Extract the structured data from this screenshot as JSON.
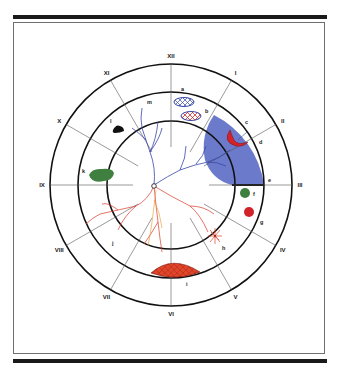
{
  "figure": {
    "type": "fundus-drawing-chart",
    "colors": {
      "frame": "#1a1a1a",
      "circle": "#111111",
      "spoke": "#555555",
      "detachment_blue": "#5b6cc4",
      "tear_red": "#d2232a",
      "hemorrhage_red": "#e0452a",
      "pigment_green": "#3f7f3f",
      "pigment_black": "#111111",
      "vein_blue": "#3848a8",
      "artery_red": "#d8382a",
      "artery_orange": "#e8962a"
    },
    "clock_hours": [
      {
        "label": "XII",
        "angle": 0
      },
      {
        "label": "I",
        "angle": 30
      },
      {
        "label": "II",
        "angle": 60
      },
      {
        "label": "III",
        "angle": 90
      },
      {
        "label": "IV",
        "angle": 120
      },
      {
        "label": "V",
        "angle": 150
      },
      {
        "label": "VI",
        "angle": 180
      },
      {
        "label": "VII",
        "angle": 210
      },
      {
        "label": "VIII",
        "angle": 240
      },
      {
        "label": "IX",
        "angle": 270
      },
      {
        "label": "X",
        "angle": 300
      },
      {
        "label": "XI",
        "angle": 330
      }
    ],
    "lesion_labels": [
      {
        "key": "a",
        "label": "a",
        "description": "lattice degeneration (blue outline, cross-hatch)"
      },
      {
        "key": "b",
        "label": "b",
        "description": "lattice with pigment (red cross-hatch)"
      },
      {
        "key": "c",
        "label": "c",
        "description": "horseshoe retinal tear"
      },
      {
        "key": "d",
        "label": "d",
        "description": "retinal detachment (blue)"
      },
      {
        "key": "e",
        "label": "e",
        "description": "demarcation line"
      },
      {
        "key": "f",
        "label": "f",
        "description": "green lesion"
      },
      {
        "key": "g",
        "label": "g",
        "description": "red hemorrhage"
      },
      {
        "key": "h",
        "label": "h",
        "description": "pigment/red star lesion"
      },
      {
        "key": "i",
        "label": "i",
        "description": "red cross-hatched area"
      },
      {
        "key": "j",
        "label": "j",
        "description": "vessels"
      },
      {
        "key": "k",
        "label": "k",
        "description": "green pigment"
      },
      {
        "key": "l",
        "label": "l",
        "description": "black pigment"
      },
      {
        "key": "m",
        "label": "m",
        "description": "retinal vein"
      }
    ]
  }
}
